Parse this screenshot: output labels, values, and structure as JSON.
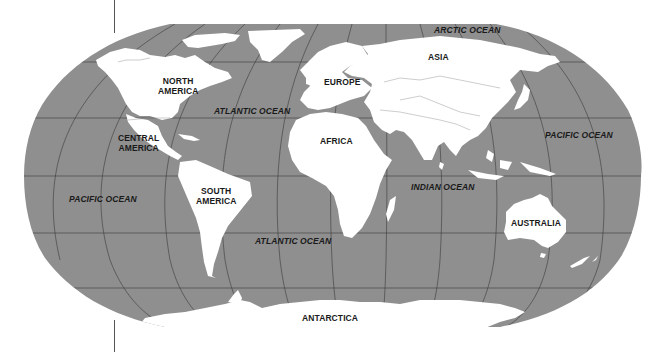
{
  "map": {
    "projection": "Robinson",
    "colors": {
      "ocean": "#8f8f8f",
      "land": "#ffffff",
      "graticule": "#3a3a3a",
      "border": "#9a9a9a",
      "label": "#1a1a1a",
      "background": "#ffffff"
    },
    "continents": [
      {
        "id": "north-america",
        "label": "NORTH\nAMERICA",
        "line1": "NORTH",
        "line2": "AMERICA"
      },
      {
        "id": "central-america",
        "label": "CENTRAL\nAMERICA",
        "line1": "CENTRAL",
        "line2": "AMERICA"
      },
      {
        "id": "south-america",
        "label": "SOUTH\nAMERICA",
        "line1": "SOUTH",
        "line2": "AMERICA"
      },
      {
        "id": "europe",
        "label": "EUROPE"
      },
      {
        "id": "africa",
        "label": "AFRICA"
      },
      {
        "id": "asia",
        "label": "ASIA"
      },
      {
        "id": "australia",
        "label": "AUSTRALIA"
      },
      {
        "id": "antarctica",
        "label": "ANTARCTICA"
      }
    ],
    "oceans": [
      {
        "id": "arctic-ocean",
        "label": "ARCTIC OCEAN"
      },
      {
        "id": "atlantic-ocean-north",
        "label": "ATLANTIC OCEAN"
      },
      {
        "id": "atlantic-ocean-south",
        "label": "ATLANTIC OCEAN"
      },
      {
        "id": "pacific-ocean-east",
        "label": "PACIFIC OCEAN"
      },
      {
        "id": "pacific-ocean-west",
        "label": "PACIFIC OCEAN"
      },
      {
        "id": "indian-ocean",
        "label": "INDIAN OCEAN"
      }
    ]
  }
}
